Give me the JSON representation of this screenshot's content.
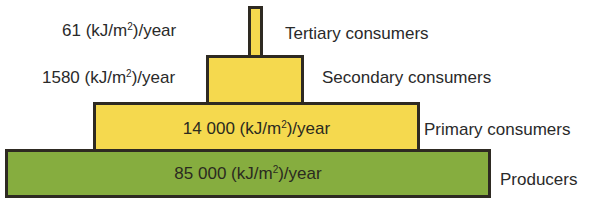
{
  "unit": "(kJ/m²)/year",
  "levels": [
    {
      "name": "Tertiary consumers",
      "value": "61",
      "value_label": "61 (kJ/m²)/year",
      "color": "#f5d94e"
    },
    {
      "name": "Secondary consumers",
      "value": "1580",
      "value_label": "1580 (kJ/m²)/year",
      "color": "#f5d94e"
    },
    {
      "name": "Primary consumers",
      "value": "14 000",
      "value_label": "14 000 (kJ/m²)/year",
      "color": "#f5d94e"
    },
    {
      "name": "Producers",
      "value": "85 000",
      "value_label": "85 000 (kJ/m²)/year",
      "color": "#86ad3f"
    }
  ]
}
